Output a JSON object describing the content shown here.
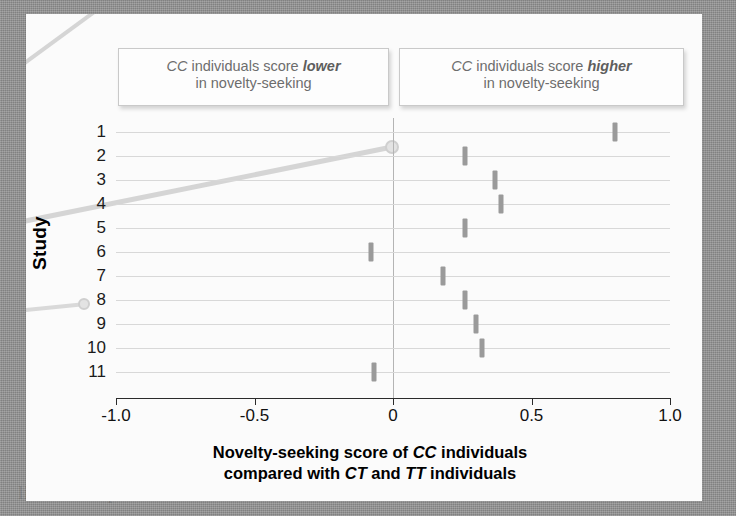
{
  "figure": {
    "y_axis_title": "Study",
    "x_axis_title_line1_a": "Novelty-seeking score of ",
    "x_axis_title_line1_em": "CC",
    "x_axis_title_line1_b": " individuals",
    "x_axis_title_line2_a": "compared with ",
    "x_axis_title_line2_em1": "CT",
    "x_axis_title_line2_b": " and ",
    "x_axis_title_line2_em2": "TT",
    "x_axis_title_line2_c": " individuals"
  },
  "callouts": {
    "lower": {
      "genotype": "CC",
      "lead": " individuals score ",
      "emphasis": "lower",
      "line2": "in novelty-seeking"
    },
    "higher": {
      "genotype": "CC",
      "lead": " individuals score ",
      "emphasis": "higher",
      "line2": "in novelty-seeking"
    }
  },
  "colors": {
    "marker": "#9a9a9a",
    "gridline": "#d8d8d8",
    "zeroline": "#b4b4b4",
    "axis": "#2b2b2b",
    "panel_background": "#fbfbfb",
    "page_background": "#909090",
    "callout_text": "#6d6d6d"
  },
  "ghost_text": [
    {
      "text": "lieve in no prenatal",
      "x": 300,
      "y": 248
    },
    {
      "text": "icing and s",
      "x": 350,
      "y": 282
    },
    {
      "text": "al risk to",
      "x": 420,
      "y": 316
    },
    {
      "text": "the risk to sub",
      "x": 70,
      "y": 462
    },
    {
      "text": "lieve in no prenatal",
      "x": 18,
      "y": 482
    }
  ],
  "chart_data": {
    "type": "scatter",
    "orientation": "horizontal",
    "title": "",
    "xlabel": "Novelty-seeking score of CC individuals compared with CT and TT individuals",
    "ylabel": "Study",
    "xlim": [
      -1.0,
      1.0
    ],
    "xticks": [
      -1.0,
      -0.5,
      0,
      0.5,
      1.0
    ],
    "xtick_labels": [
      "-1.0",
      "-0.5",
      "0",
      "0.5",
      "1.0"
    ],
    "grid": true,
    "grid_axis": "y",
    "reference_line": 0,
    "legend": "none",
    "categories": [
      "1",
      "2",
      "3",
      "4",
      "5",
      "6",
      "7",
      "8",
      "9",
      "10",
      "11"
    ],
    "values": [
      0.8,
      0.26,
      0.37,
      0.39,
      0.26,
      -0.08,
      0.18,
      0.26,
      0.3,
      0.32,
      -0.07
    ],
    "points": [
      {
        "study": "1",
        "effect": 0.8
      },
      {
        "study": "2",
        "effect": 0.26
      },
      {
        "study": "3",
        "effect": 0.37
      },
      {
        "study": "4",
        "effect": 0.39
      },
      {
        "study": "5",
        "effect": 0.26
      },
      {
        "study": "6",
        "effect": -0.08
      },
      {
        "study": "7",
        "effect": 0.18
      },
      {
        "study": "8",
        "effect": 0.26
      },
      {
        "study": "9",
        "effect": 0.3
      },
      {
        "study": "10",
        "effect": 0.32
      },
      {
        "study": "11",
        "effect": -0.07
      }
    ]
  }
}
